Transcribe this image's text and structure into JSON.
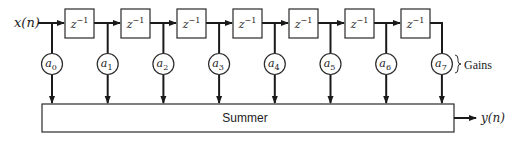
{
  "diagram": {
    "type": "fir-filter-tapped-delay-line",
    "input_label": "x(n)",
    "output_label": "y(n)",
    "delay_label_base": "z",
    "delay_label_exp": "−1",
    "delay_count": 7,
    "gains": [
      {
        "base": "a",
        "sub": "0"
      },
      {
        "base": "a",
        "sub": "1"
      },
      {
        "base": "a",
        "sub": "2"
      },
      {
        "base": "a",
        "sub": "3"
      },
      {
        "base": "a",
        "sub": "4"
      },
      {
        "base": "a",
        "sub": "5"
      },
      {
        "base": "a",
        "sub": "6"
      },
      {
        "base": "a",
        "sub": "7"
      }
    ],
    "gains_label": "Gains",
    "summer_label": "Summer"
  }
}
